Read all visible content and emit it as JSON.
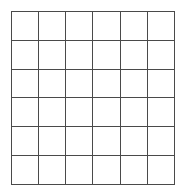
{
  "page": {
    "background_color": "#ffffff"
  },
  "grid": {
    "name": "blank-grid",
    "rows": 6,
    "columns": 6,
    "line_color": "#4a4a4a",
    "line_width_px": 1,
    "cell_fill_color": "#ffffff",
    "left_px": 11,
    "top_px": 11,
    "width_px": 157,
    "height_px": 167,
    "cells": [
      [
        "",
        "",
        "",
        "",
        "",
        ""
      ],
      [
        "",
        "",
        "",
        "",
        "",
        ""
      ],
      [
        "",
        "",
        "",
        "",
        "",
        ""
      ],
      [
        "",
        "",
        "",
        "",
        "",
        ""
      ],
      [
        "",
        "",
        "",
        "",
        "",
        ""
      ],
      [
        "",
        "",
        "",
        "",
        "",
        ""
      ]
    ]
  }
}
